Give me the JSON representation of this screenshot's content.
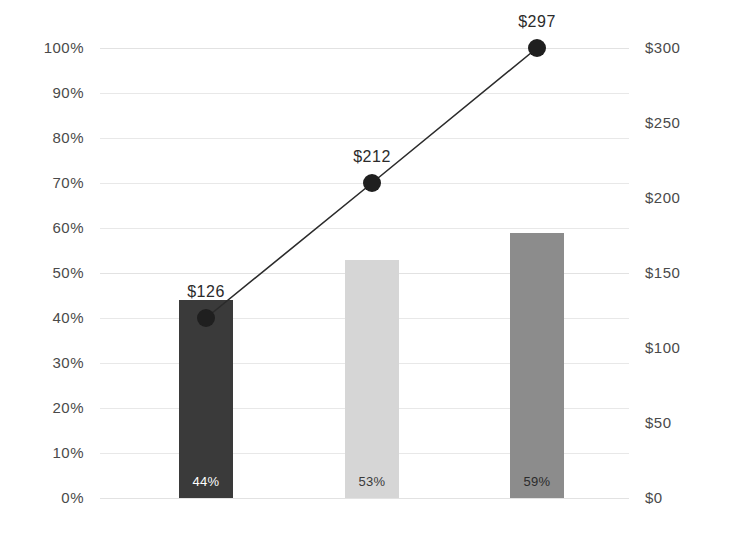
{
  "chart_data": {
    "type": "bar",
    "title": "",
    "subtitle": "",
    "xlabel": "",
    "ylabel": "",
    "categories": [
      "",
      "",
      ""
    ],
    "grid": true,
    "legend": "none",
    "axes": {
      "left": {
        "type": "percent",
        "ylim": [
          0,
          100
        ],
        "ticks": [
          {
            "value": 100,
            "label": "100%"
          },
          {
            "value": 90,
            "label": "90%"
          },
          {
            "value": 80,
            "label": "80%"
          },
          {
            "value": 70,
            "label": "70%"
          },
          {
            "value": 60,
            "label": "60%"
          },
          {
            "value": 50,
            "label": "50%"
          },
          {
            "value": 40,
            "label": "40%"
          },
          {
            "value": 30,
            "label": "30%"
          },
          {
            "value": 20,
            "label": "20%"
          },
          {
            "value": 10,
            "label": "10%"
          },
          {
            "value": 0,
            "label": "0%"
          }
        ]
      },
      "right": {
        "type": "currency",
        "ylim": [
          0,
          300
        ],
        "ticks": [
          {
            "value": 300,
            "label": "$300"
          },
          {
            "value": 250,
            "label": "$250"
          },
          {
            "value": 200,
            "label": "$200"
          },
          {
            "value": 150,
            "label": "$150"
          },
          {
            "value": 100,
            "label": "$100"
          },
          {
            "value": 50,
            "label": "$50"
          },
          {
            "value": 0,
            "label": "$0"
          }
        ]
      }
    },
    "series": [
      {
        "name": "percent-bars",
        "kind": "bar",
        "axis": "left",
        "values": [
          44,
          53,
          59
        ],
        "labels": [
          "44%",
          "53%",
          "59%"
        ],
        "colors": [
          "#3a3a3a",
          "#d6d6d6",
          "#8c8c8c"
        ],
        "label_colors": [
          "#ffffff",
          "#3a3a3a",
          "#2b2b2b"
        ]
      },
      {
        "name": "dollar-line",
        "kind": "line",
        "axis": "left",
        "plot_values": [
          40,
          70,
          100
        ],
        "values": [
          126,
          212,
          297
        ],
        "labels": [
          "$126",
          "$212",
          "$297"
        ],
        "line_color": "#2b2b2b",
        "marker_color": "#1f1f1f"
      }
    ]
  }
}
